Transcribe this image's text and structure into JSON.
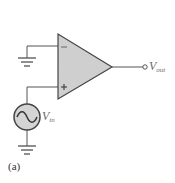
{
  "diagram": {
    "colors": {
      "wire": "#555555",
      "opamp_fill": "#cfcfcf",
      "opamp_stroke": "#444444",
      "label": "#6b6b6b"
    },
    "opamp": {
      "inverting_symbol": "−",
      "noninverting_symbol": "+"
    },
    "labels": {
      "vout_main": "V",
      "vout_sub": "out",
      "vin_main": "V",
      "vin_sub": "in"
    },
    "source": {
      "icon": "ac-source-icon",
      "glyph": "~"
    },
    "caption": "(a)"
  }
}
